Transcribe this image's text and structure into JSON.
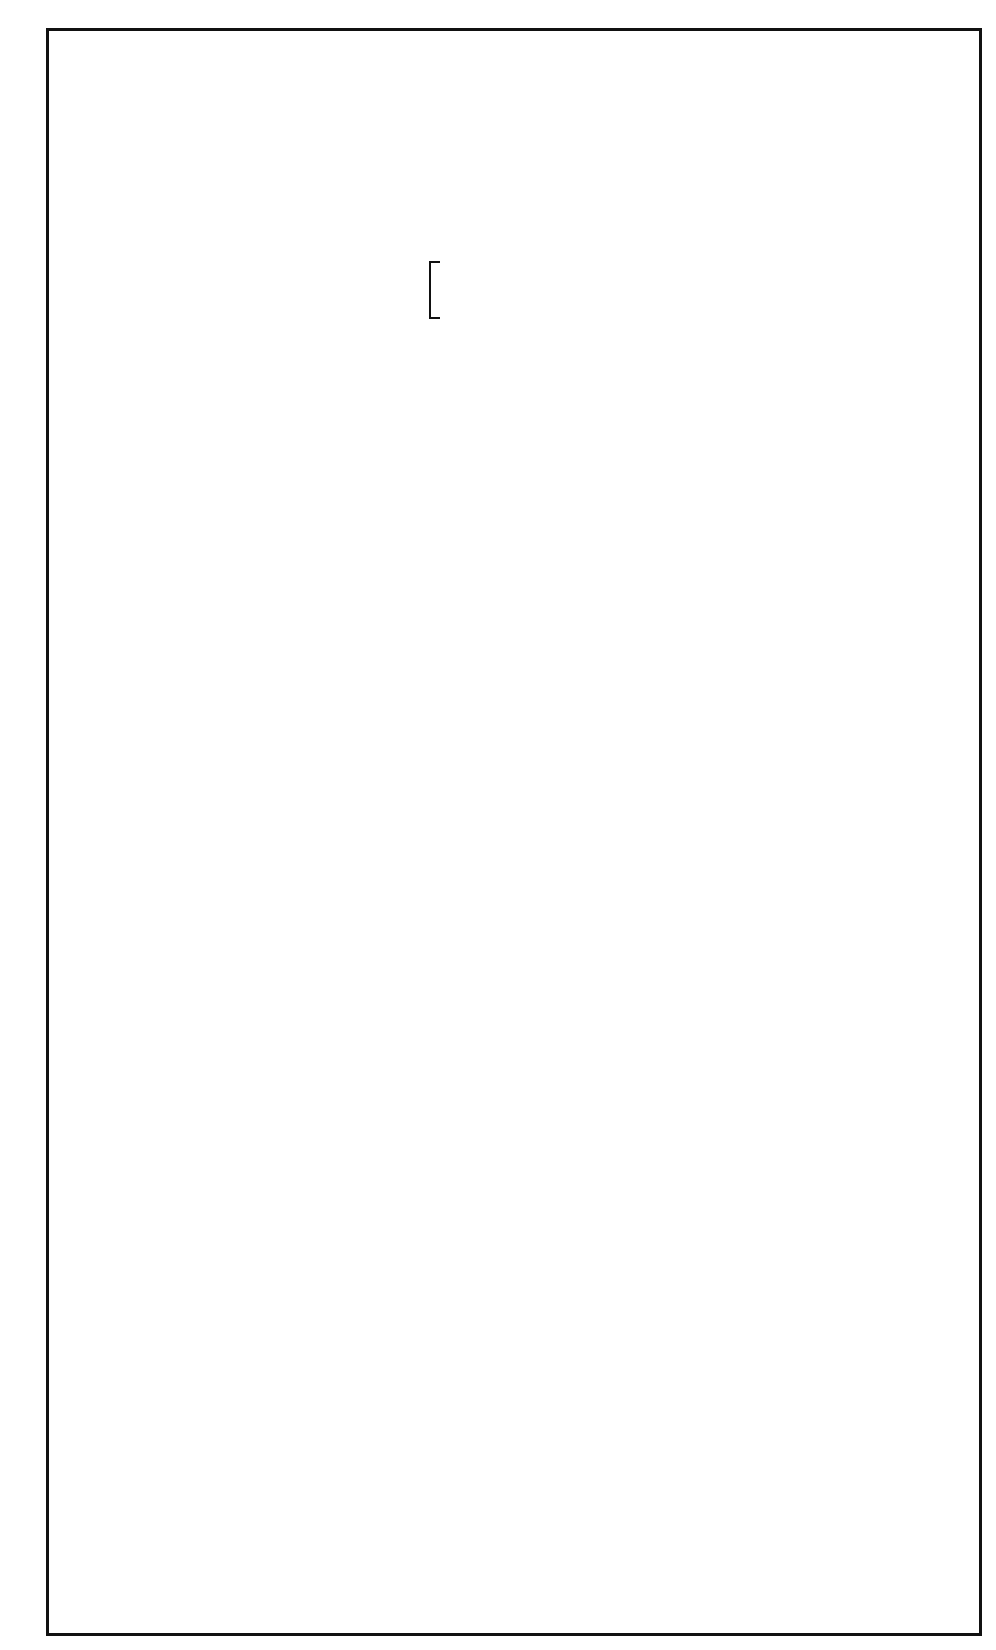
{
  "figure": {
    "orientation": "rotated 90deg counter-clockwise (time runs bottom to top)",
    "scale_bar": {
      "label": "100 msec"
    },
    "trace_color_default": "#111111",
    "trace_color_abl": "#2c4f86"
  },
  "channels": [
    {
      "name": "I",
      "x": 106
    },
    {
      "name": "II",
      "x": 146
    },
    {
      "name": "III",
      "x": 208
    },
    {
      "name": "V1",
      "x": 274
    },
    {
      "name": "HRA3-4",
      "x": 325
    },
    {
      "name": "HBE1-2",
      "x": 378
    },
    {
      "name": "HBE3-4",
      "x": 428
    },
    {
      "name": "HBE5-6",
      "x": 486
    },
    {
      "name": "HBE7-8",
      "x": 540
    },
    {
      "name": "CS1-2",
      "x": 596
    },
    {
      "name": "CS3-4",
      "x": 648
    },
    {
      "name": "CS5-6",
      "x": 702
    },
    {
      "name": "CS7-8",
      "x": 755
    },
    {
      "name": "CSos",
      "x": 818
    },
    {
      "name": "ABL",
      "sublabel": "(isthmus)",
      "x": 870
    }
  ],
  "annotations": {
    "intervals": [
      {
        "text": "245",
        "x": 846,
        "y": 1235
      },
      {
        "text": "245",
        "x": 846,
        "y": 1042
      },
      {
        "text": "210",
        "x": 846,
        "y": 380
      },
      {
        "text": "210",
        "x": 846,
        "y": 183
      }
    ],
    "stimulus_marks": [
      {
        "text": "S",
        "x": 846,
        "y": 455
      },
      {
        "text": "S",
        "x": 846,
        "y": 283
      },
      {
        "text": "S",
        "x": 846,
        "y": 100
      }
    ],
    "his_marks": [
      {
        "text": "H",
        "x": 455,
        "y": 925
      },
      {
        "text": "H",
        "x": 455,
        "y": 233
      }
    ]
  },
  "beats": {
    "sinus_qrs_y": [
      875,
      150
    ],
    "atrial_y": [
      1240,
      1043,
      900,
      725,
      500,
      330
    ],
    "pacing_spikes_y": [
      600,
      428,
      255,
      88
    ]
  }
}
